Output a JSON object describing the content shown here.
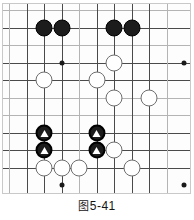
{
  "figure": {
    "caption_cjk": "图",
    "caption_number": "5-41",
    "caption_full": "图 5-41"
  },
  "board": {
    "type": "go-board-diagram",
    "columns": 10,
    "rows": 10,
    "cell_size": 17.5,
    "origin_x": 9,
    "origin_y": 10,
    "line_color": "#4a4a4a",
    "pale_line_color": "#b4b4b4",
    "background": "#fdfdfd",
    "border_color": "#c9c9c9",
    "black_color": "#1c1c1c",
    "white_color": "#ffffff",
    "white_edge_color": "#6e6e6e",
    "marker_color": "#ffffff",
    "star_points": [
      {
        "col": 3,
        "row": 3
      },
      {
        "col": 10,
        "row": 3
      },
      {
        "col": 3,
        "row": 10
      },
      {
        "col": 10,
        "row": 10
      }
    ],
    "stones": [
      {
        "col": 2,
        "row": 1,
        "color": "black",
        "marker": "none",
        "name": "black-stone-c2r1"
      },
      {
        "col": 3,
        "row": 1,
        "color": "black",
        "marker": "none",
        "name": "black-stone-c3r1"
      },
      {
        "col": 6,
        "row": 1,
        "color": "black",
        "marker": "none",
        "name": "black-stone-c6r1"
      },
      {
        "col": 7,
        "row": 1,
        "color": "black",
        "marker": "none",
        "name": "black-stone-c7r1"
      },
      {
        "col": 6,
        "row": 3,
        "color": "white",
        "marker": "none",
        "name": "white-stone-c6r3"
      },
      {
        "col": 2,
        "row": 4,
        "color": "white",
        "marker": "none",
        "name": "white-stone-c2r4"
      },
      {
        "col": 5,
        "row": 4,
        "color": "white",
        "marker": "none",
        "name": "white-stone-c5r4"
      },
      {
        "col": 6,
        "row": 5,
        "color": "white",
        "marker": "none",
        "name": "white-stone-c6r5"
      },
      {
        "col": 8,
        "row": 5,
        "color": "white",
        "marker": "none",
        "name": "white-stone-c8r5"
      },
      {
        "col": 2,
        "row": 7,
        "color": "black",
        "marker": "triangle",
        "name": "black-marked-stone-c2r7"
      },
      {
        "col": 5,
        "row": 7,
        "color": "black",
        "marker": "triangle",
        "name": "black-marked-stone-c5r7"
      },
      {
        "col": 2,
        "row": 8,
        "color": "black",
        "marker": "triangle",
        "name": "black-marked-stone-c2r8"
      },
      {
        "col": 5,
        "row": 8,
        "color": "black",
        "marker": "triangle",
        "name": "black-marked-stone-c5r8"
      },
      {
        "col": 6,
        "row": 8,
        "color": "white",
        "marker": "none",
        "name": "white-stone-c6r8"
      },
      {
        "col": 2,
        "row": 9,
        "color": "white",
        "marker": "none",
        "name": "white-stone-c2r9"
      },
      {
        "col": 3,
        "row": 9,
        "color": "white",
        "marker": "none",
        "name": "white-stone-c3r9"
      },
      {
        "col": 4,
        "row": 9,
        "color": "white",
        "marker": "none",
        "name": "white-stone-c4r9"
      },
      {
        "col": 7,
        "row": 9,
        "color": "white",
        "marker": "none",
        "name": "white-stone-c7r9"
      }
    ],
    "pale_rows": [
      0,
      2,
      5,
      6
    ],
    "pale_cols": [
      0,
      4,
      9
    ]
  }
}
